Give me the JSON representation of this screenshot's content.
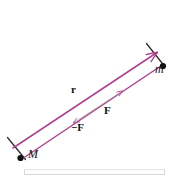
{
  "figure": {
    "type": "physics-vector-diagram",
    "background_color": "#ffffff",
    "vector_color": "#b0408f",
    "force_line_color": "#9a9a9a",
    "point_color": "#111111",
    "tick_color": "#111111",
    "labels": {
      "mass_large": "M",
      "mass_small": "m",
      "separation_vector": "r",
      "force_on_m": "F",
      "force_on_M": "−F"
    },
    "points": [
      {
        "name": "mass-M",
        "label": "M",
        "x": 20,
        "y": 157
      },
      {
        "name": "mass-m",
        "label": "m",
        "x": 155,
        "y": 66
      }
    ],
    "vectors": [
      {
        "name": "r-vector-upper",
        "label": "r",
        "from": [
          13,
          148
        ],
        "to": [
          158,
          52
        ],
        "arrow": "end"
      },
      {
        "name": "r-vector-lower",
        "label": "r",
        "from": [
          20,
          160
        ],
        "to": [
          164,
          64
        ],
        "arrow": "end"
      },
      {
        "name": "force-pair-line",
        "label": "F / −F",
        "from": [
          72,
          124
        ],
        "to": [
          124,
          90
        ],
        "arrow": "both"
      }
    ],
    "ticks": [
      {
        "name": "tick-at-M",
        "from": [
          8,
          138
        ],
        "to": [
          26,
          160
        ]
      },
      {
        "name": "tick-at-m",
        "from": [
          147,
          44
        ],
        "to": [
          164,
          66
        ]
      }
    ]
  },
  "bottom_rule": {
    "name": "figure-baseline-rule",
    "visible": true
  }
}
